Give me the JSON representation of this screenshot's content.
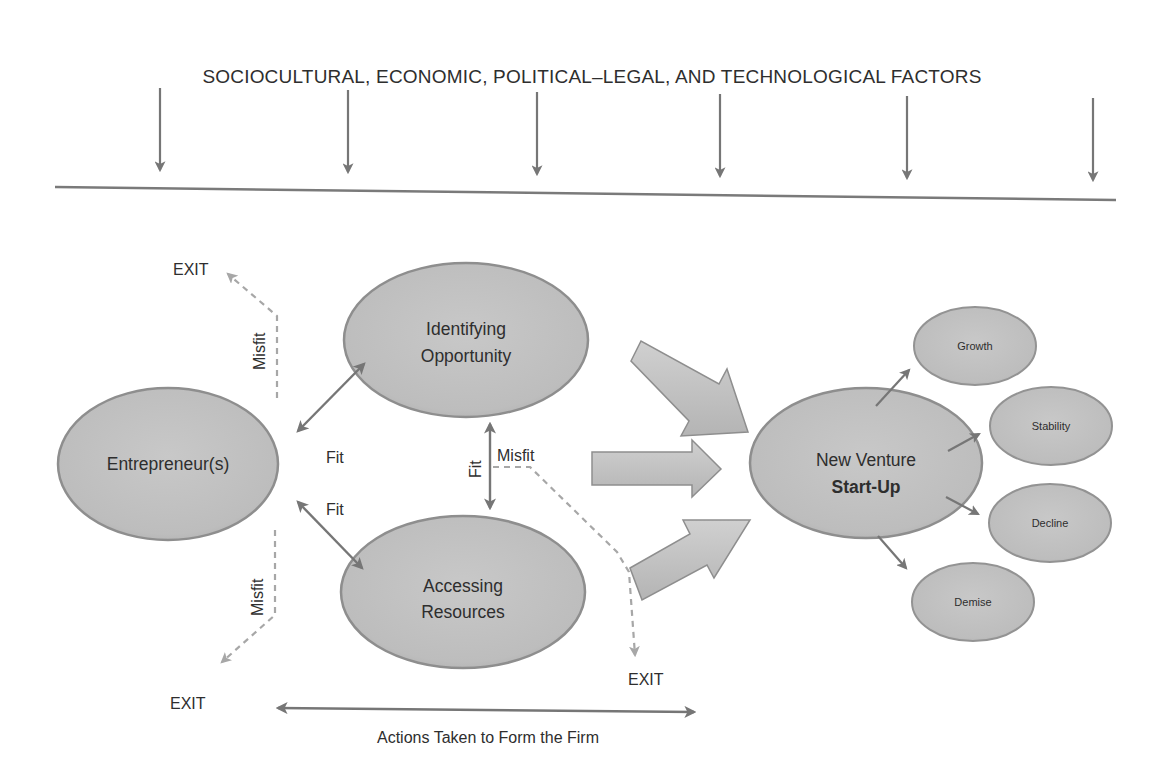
{
  "colors": {
    "background": "#ffffff",
    "ellipse_fill": "#c2c2c2",
    "ellipse_stroke": "#8e8e8e",
    "arrow": "#767676",
    "exit_dashed": "#a7a7a7",
    "text": "#2e2e2e"
  },
  "environment": {
    "title": "SOCIOCULTURAL, ECONOMIC, POLITICAL–LEGAL, AND TECHNOLOGICAL FACTORS",
    "arrow_count": 6
  },
  "nodes": {
    "entrepreneur": "Entrepreneur(s)",
    "opportunity_line1": "Identifying",
    "opportunity_line2": "Opportunity",
    "resources_line1": "Accessing",
    "resources_line2": "Resources",
    "venture_line1": "New Venture",
    "venture_line2": "Start-Up"
  },
  "outcomes": [
    "Growth",
    "Stability",
    "Decline",
    "Demise"
  ],
  "connector_labels": {
    "fit_upper": "Fit",
    "fit_lower": "Fit",
    "fit_vertical": "Fit",
    "misfit_upper": "Misfit",
    "misfit_lower": "Misfit",
    "misfit_center": "Misfit"
  },
  "exits": {
    "top_left": "EXIT",
    "bottom_left": "EXIT",
    "bottom_center": "EXIT"
  },
  "footer": {
    "caption": "Actions Taken to Form the Firm"
  }
}
